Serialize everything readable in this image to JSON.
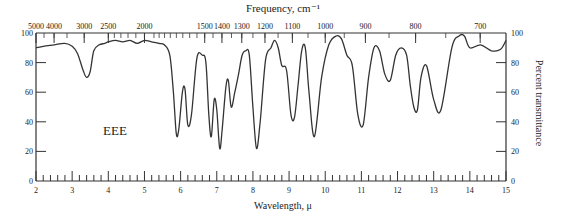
{
  "chart_data": {
    "type": "line",
    "title": "",
    "sample_label": "EEE",
    "top_axis_label": "Frequency, cm⁻¹",
    "xlabel": "Wavelength, μ",
    "ylabel_right": "Percent transmittance",
    "xlim": [
      2,
      15
    ],
    "ylim": [
      0,
      100
    ],
    "x_ticks": [
      2,
      3,
      4,
      5,
      6,
      7,
      8,
      9,
      10,
      11,
      12,
      13,
      14,
      15
    ],
    "y_ticks_left": [
      0,
      20,
      40,
      60,
      80,
      100
    ],
    "y_ticks_right": [
      0,
      20,
      40,
      60,
      80,
      100
    ],
    "top_ticks": [
      {
        "label": "5000",
        "wavelength": 2.0
      },
      {
        "label": "4000",
        "wavelength": 2.5
      },
      {
        "label": "3000",
        "wavelength": 3.333
      },
      {
        "label": "2500",
        "wavelength": 4.0
      },
      {
        "label": "2000",
        "wavelength": 5.0
      },
      {
        "label": "1500",
        "wavelength": 6.667
      },
      {
        "label": "1400",
        "wavelength": 7.143
      },
      {
        "label": "1300",
        "wavelength": 7.692
      },
      {
        "label": "1200",
        "wavelength": 8.333
      },
      {
        "label": "1100",
        "wavelength": 9.091
      },
      {
        "label": "1000",
        "wavelength": 10.0
      },
      {
        "label": "900",
        "wavelength": 11.111
      },
      {
        "label": "800",
        "wavelength": 12.5
      },
      {
        "label": "700",
        "wavelength": 14.286
      }
    ],
    "grid": false,
    "series": [
      {
        "name": "EEE",
        "x": [
          2.0,
          2.2,
          2.5,
          2.8,
          3.0,
          3.15,
          3.3,
          3.4,
          3.5,
          3.6,
          3.75,
          3.9,
          4.0,
          4.2,
          4.4,
          4.6,
          4.8,
          5.0,
          5.2,
          5.4,
          5.55,
          5.7,
          5.8,
          5.88,
          5.95,
          6.05,
          6.12,
          6.2,
          6.3,
          6.45,
          6.6,
          6.7,
          6.78,
          6.85,
          6.93,
          7.0,
          7.08,
          7.15,
          7.25,
          7.32,
          7.4,
          7.5,
          7.6,
          7.7,
          7.8,
          7.9,
          8.0,
          8.1,
          8.2,
          8.35,
          8.5,
          8.6,
          8.7,
          8.8,
          8.93,
          9.05,
          9.15,
          9.25,
          9.35,
          9.45,
          9.55,
          9.7,
          9.9,
          10.1,
          10.3,
          10.45,
          10.6,
          10.75,
          10.9,
          11.05,
          11.2,
          11.35,
          11.5,
          11.65,
          11.8,
          11.95,
          12.1,
          12.25,
          12.35,
          12.45,
          12.55,
          12.65,
          12.8,
          13.0,
          13.2,
          13.5,
          13.7,
          13.85,
          14.0,
          14.3,
          14.6,
          14.85,
          15.0
        ],
        "y": [
          90,
          91,
          92,
          93,
          91,
          86,
          75,
          70,
          74,
          88,
          92,
          93,
          94,
          95,
          94,
          95,
          93,
          95,
          94,
          93,
          92,
          85,
          60,
          32,
          35,
          60,
          62,
          38,
          45,
          83,
          85,
          80,
          45,
          30,
          55,
          48,
          22,
          35,
          63,
          68,
          50,
          60,
          72,
          85,
          88,
          85,
          50,
          22,
          40,
          82,
          90,
          95,
          90,
          78,
          75,
          45,
          43,
          65,
          88,
          90,
          60,
          30,
          70,
          92,
          98,
          96,
          85,
          78,
          45,
          38,
          70,
          90,
          88,
          72,
          68,
          85,
          90,
          85,
          65,
          50,
          48,
          70,
          78,
          55,
          48,
          90,
          98,
          98,
          90,
          92,
          88,
          89,
          95
        ]
      }
    ]
  }
}
